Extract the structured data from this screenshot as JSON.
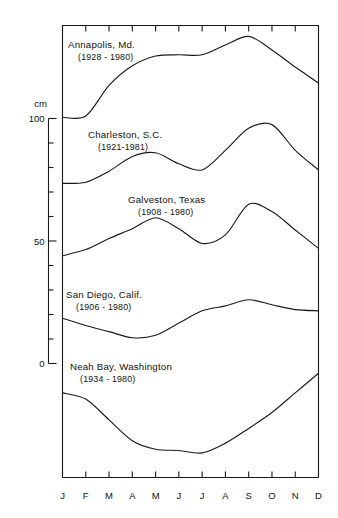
{
  "chart_data": {
    "type": "line",
    "title": "",
    "xlabel": "",
    "ylabel": "cm",
    "grid": false,
    "legend_position": "inline-annotations",
    "categories": [
      "J",
      "F",
      "M",
      "A",
      "M",
      "J",
      "J",
      "A",
      "S",
      "O",
      "N",
      "D"
    ],
    "x_tick_labels": [
      "J",
      "F",
      "M",
      "A",
      "M",
      "J",
      "J",
      "A",
      "S",
      "O",
      "N",
      "D"
    ],
    "y_tick_labels": [
      "100",
      "50",
      "0"
    ],
    "y_ticks_major": [
      100,
      50,
      0
    ],
    "y_minor_tick_step": 10,
    "ylim": [
      -90,
      110
    ],
    "axis_unit": "cm",
    "note": "Each station curve is vertically offset on a shared cm scale; values are relative sea-level / monthly mean in cm.",
    "series": [
      {
        "name": "Annapolis, Md.",
        "years": "(1928 - 1980)",
        "label_x": 68,
        "label_y": 48,
        "values": [
          100.5,
          101.0,
          113.5,
          121.5,
          125.5,
          126.0,
          126.0,
          130.0,
          133.5,
          128.0,
          121.0,
          114.5
        ]
      },
      {
        "name": "Charleston, S.C.",
        "years": "(1921-1981)",
        "label_x": 88,
        "label_y": 138,
        "values": [
          73.5,
          74.0,
          78.5,
          84.5,
          86.0,
          81.5,
          79.0,
          87.0,
          96.0,
          97.5,
          87.0,
          79.0
        ]
      },
      {
        "name": "Galveston, Texas",
        "years": "(1908 - 1980)",
        "label_x": 128,
        "label_y": 203,
        "values": [
          44.0,
          46.5,
          51.0,
          55.0,
          59.5,
          55.0,
          49.0,
          52.5,
          65.0,
          62.0,
          54.5,
          47.0
        ]
      },
      {
        "name": "San Diego, Calif.",
        "years": "(1906 - 1980)",
        "label_x": 66,
        "label_y": 298,
        "values": [
          18.5,
          15.5,
          13.0,
          10.5,
          11.5,
          16.5,
          21.5,
          23.5,
          26.0,
          24.0,
          22.0,
          21.5
        ]
      },
      {
        "name": "Neah Bay, Washington",
        "years": "(1934 - 1980)",
        "label_x": 70,
        "label_y": 370,
        "values": [
          -12.0,
          -14.5,
          -23.0,
          -31.5,
          -35.0,
          -35.5,
          -36.5,
          -32.5,
          -26.5,
          -20.0,
          -12.0,
          -4.0
        ]
      }
    ]
  },
  "axis": {
    "unit_label": "cm",
    "y_labels": [
      {
        "text": "100",
        "value": 100
      },
      {
        "text": "50",
        "value": 50
      },
      {
        "text": "0",
        "value": 0
      }
    ],
    "x_labels": [
      "J",
      "F",
      "M",
      "A",
      "M",
      "J",
      "J",
      "A",
      "S",
      "O",
      "N",
      "D"
    ]
  }
}
